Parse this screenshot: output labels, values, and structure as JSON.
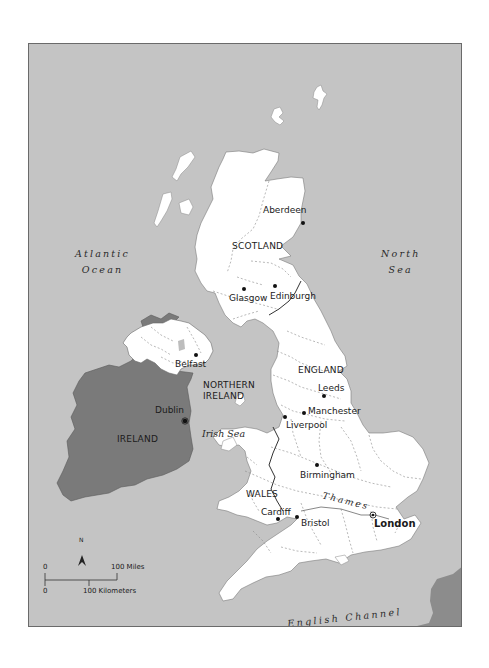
{
  "map": {
    "colors": {
      "sea": "#c4c4c4",
      "great_britain": "#ffffff",
      "ireland": "#7a7a7a",
      "france": "#8c8c8c",
      "frame": "#6a6a6a",
      "text": "#1a1a1a"
    },
    "seas": {
      "atlantic_line1": "Atlantic",
      "atlantic_line2": "Ocean",
      "north_line1": "North",
      "north_line2": "Sea",
      "irish_sea": "Irish Sea",
      "english_channel": "English Channel",
      "river_thames": "Thames"
    },
    "countries": {
      "scotland": "SCOTLAND",
      "england": "ENGLAND",
      "wales": "WALES",
      "northern_ireland_line1": "NORTHERN",
      "northern_ireland_line2": "IRELAND",
      "ireland": "IRELAND"
    },
    "cities": {
      "aberdeen": "Aberdeen",
      "glasgow": "Glasgow",
      "edinburgh": "Edinburgh",
      "belfast": "Belfast",
      "dublin": "Dublin",
      "leeds": "Leeds",
      "manchester": "Manchester",
      "liverpool": "Liverpool",
      "birmingham": "Birmingham",
      "cardiff": "Cardiff",
      "bristol": "Bristol",
      "london": "London"
    },
    "legend": {
      "north_arrow": "N",
      "miles_zero": "0",
      "miles_label": "100 Miles",
      "km_zero": "0",
      "km_label": "100 Kilometers"
    }
  }
}
